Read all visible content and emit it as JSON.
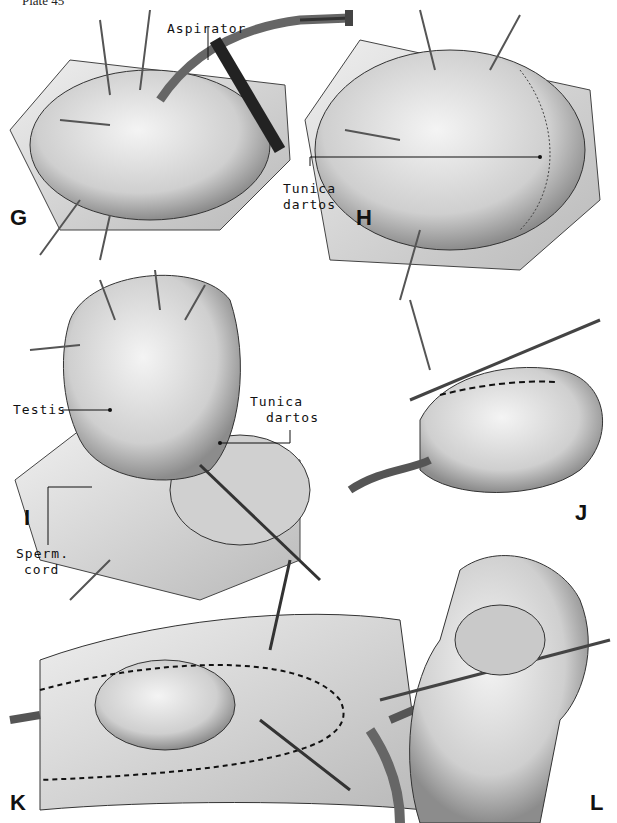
{
  "plate": {
    "caption": "Plate 45"
  },
  "panels": {
    "G": {
      "letter": "G",
      "labels": {
        "aspirator": "Aspirator"
      }
    },
    "H": {
      "letter": "H",
      "labels": {
        "tunica": "Tunica",
        "dartos": "dartos"
      }
    },
    "I": {
      "letter": "I",
      "labels": {
        "testis": "Testis",
        "tunica": "Tunica",
        "dartos": "dartos",
        "sperm": "Sperm.",
        "cord": "cord"
      }
    },
    "J": {
      "letter": "J"
    },
    "K": {
      "letter": "K"
    },
    "L": {
      "letter": "L"
    }
  },
  "colors": {
    "ink": "#111111",
    "tissue": "#d9d9d9",
    "shade": "#9a9a9a",
    "paper": "#ffffff"
  }
}
